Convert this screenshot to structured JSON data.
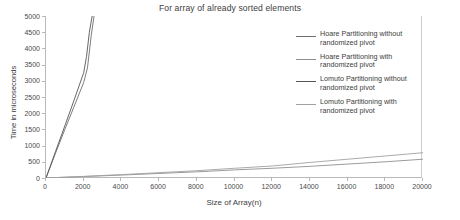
{
  "chart_data": {
    "type": "line",
    "title": "For array of already sorted elements",
    "xlabel": "Size of Array(n)",
    "ylabel": "Time in microseconds",
    "xlim": [
      0,
      20000
    ],
    "ylim": [
      0,
      5000
    ],
    "xticks": [
      0,
      2000,
      4000,
      6000,
      8000,
      10000,
      12000,
      14000,
      16000,
      18000,
      20000
    ],
    "yticks": [
      0,
      500,
      1000,
      1500,
      2000,
      2500,
      3000,
      3500,
      4000,
      4500,
      5000
    ],
    "grid": false,
    "legend_position": "right",
    "series": [
      {
        "name": "Hoare Partitioning without randomized pivot",
        "color": "#6e6e6e",
        "x": [
          0,
          500,
          1000,
          1500,
          2000,
          2200,
          2400,
          2550
        ],
        "y": [
          0,
          760,
          1500,
          2220,
          2950,
          3400,
          4400,
          5000
        ]
      },
      {
        "name": "Hoare Partitioning with randomized pivot",
        "color": "#909090",
        "x": [
          0,
          2000,
          4000,
          6000,
          8000,
          10000,
          12000,
          14000,
          16000,
          18000,
          20000
        ],
        "y": [
          0,
          45,
          90,
          140,
          190,
          250,
          300,
          360,
          430,
          500,
          580
        ]
      },
      {
        "name": "Lomuto Partitioning without randomized pivot",
        "color": "#555555",
        "x": [
          0,
          500,
          1000,
          1500,
          2000,
          2150,
          2300,
          2450
        ],
        "y": [
          0,
          810,
          1610,
          2420,
          3250,
          3750,
          4500,
          5000
        ]
      },
      {
        "name": "Lomuto Partitioning with randomized pivot",
        "color": "#a0a0a0",
        "x": [
          0,
          2000,
          4000,
          6000,
          8000,
          10000,
          12000,
          14000,
          16000,
          18000,
          20000
        ],
        "y": [
          0,
          50,
          105,
          165,
          225,
          300,
          370,
          480,
          580,
          680,
          780
        ]
      }
    ]
  },
  "legend": {
    "entries": [
      {
        "label": "Hoare Partitioning without\nrandomized pivot"
      },
      {
        "label": "Hoare Partitioning with\nrandomized pivot"
      },
      {
        "label": "Lomuto Partitioning without\nrandomized pivot"
      },
      {
        "label": "Lomuto Partitioning with\nrandomized pivot"
      }
    ]
  }
}
